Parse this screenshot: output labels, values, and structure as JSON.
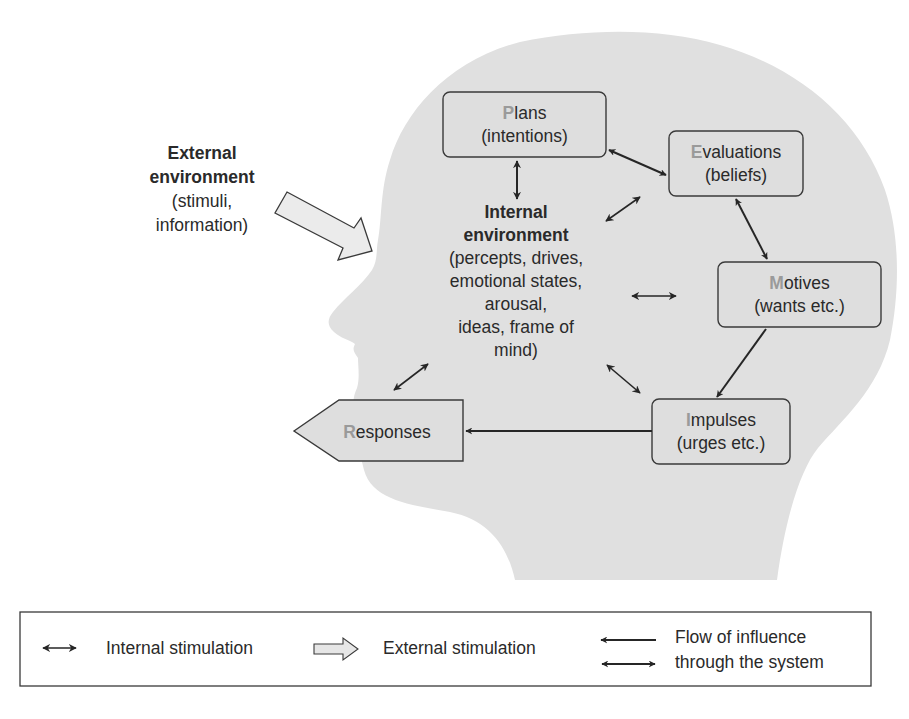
{
  "external": {
    "title_line1": "External",
    "title_line2": "environment",
    "sub_line1": "(stimuli,",
    "sub_line2": "information)"
  },
  "internal": {
    "title_line1": "Internal",
    "title_line2": "environment",
    "lines": [
      "(percepts, drives,",
      "emotional states,",
      "arousal,",
      "ideas, frame of",
      "mind)"
    ]
  },
  "nodes": {
    "plans": {
      "initial": "P",
      "rest": "lans",
      "sub": "(intentions)"
    },
    "evaluations": {
      "initial": "E",
      "rest": "valuations",
      "sub": "(beliefs)"
    },
    "motives": {
      "initial": "M",
      "rest": "otives",
      "sub": "(wants etc.)"
    },
    "impulses": {
      "initial": "I",
      "rest": "mpulses",
      "sub": "(urges etc.)"
    },
    "responses": {
      "initial": "R",
      "rest": "esponses"
    }
  },
  "legend": {
    "internal_label": "Internal stimulation",
    "external_label": "External stimulation",
    "flow_line1": "Flow of influence",
    "flow_line2": "through the system"
  },
  "colors": {
    "head_fill": "#e0e0e0",
    "box_fill": "#dedede",
    "initial_letter": "#9a9a9a",
    "stroke": "#262626"
  }
}
